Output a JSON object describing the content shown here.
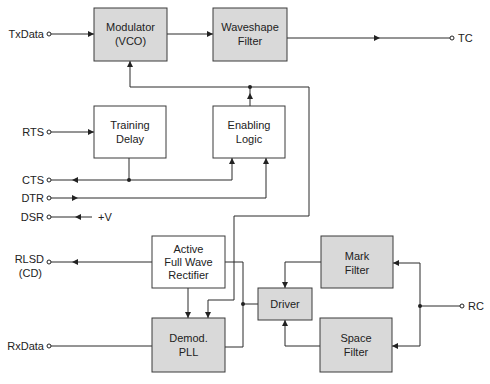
{
  "diagram": {
    "type": "block-diagram",
    "blocks": {
      "modulator": {
        "line1": "Modulator",
        "line2": "(VCO)",
        "shaded": true
      },
      "waveshape": {
        "line1": "Waveshape",
        "line2": "Filter",
        "shaded": true
      },
      "training": {
        "line1": "Training",
        "line2": "Delay",
        "shaded": false
      },
      "enabling": {
        "line1": "Enabling",
        "line2": "Logic",
        "shaded": false
      },
      "rectifier": {
        "line1": "Active",
        "line2": "Full Wave",
        "line3": "Rectifier",
        "shaded": false
      },
      "demod": {
        "line1": "Demod.",
        "line2": "PLL",
        "shaded": true
      },
      "driver": {
        "line1": "Driver",
        "shaded": true
      },
      "mark": {
        "line1": "Mark",
        "line2": "Filter",
        "shaded": true
      },
      "space": {
        "line1": "Space",
        "line2": "Filter",
        "shaded": true
      }
    },
    "signals": {
      "txdata": "TxData",
      "tc": "TC",
      "rts": "RTS",
      "cts": "CTS",
      "dtr": "DTR",
      "dsr": "DSR",
      "plusv": "+V",
      "rlsd": "RLSD",
      "cd": "(CD)",
      "rxdata": "RxData",
      "rc": "RC"
    },
    "connections": [
      {
        "from": "TxData",
        "to": "Modulator (VCO)"
      },
      {
        "from": "Modulator (VCO)",
        "to": "Waveshape Filter"
      },
      {
        "from": "Waveshape Filter",
        "to": "TC"
      },
      {
        "from": "RTS",
        "to": "Training Delay"
      },
      {
        "from": "Training Delay",
        "to": "CTS"
      },
      {
        "from": "Training Delay",
        "to": "Enabling Logic"
      },
      {
        "from": "DTR",
        "to": "Enabling Logic"
      },
      {
        "from": "+V",
        "to": "DSR"
      },
      {
        "from": "Enabling Logic",
        "to": "Modulator (VCO)"
      },
      {
        "from": "Enabling Logic",
        "to": "Demod. PLL"
      },
      {
        "from": "Active Full Wave Rectifier",
        "to": "RLSD (CD)"
      },
      {
        "from": "Active Full Wave Rectifier",
        "to": "Demod. PLL"
      },
      {
        "from": "Driver",
        "to": "Active Full Wave Rectifier"
      },
      {
        "from": "Driver",
        "to": "Demod. PLL"
      },
      {
        "from": "Demod. PLL",
        "to": "RxData"
      },
      {
        "from": "Mark Filter",
        "to": "Driver"
      },
      {
        "from": "Space Filter",
        "to": "Driver"
      },
      {
        "from": "RC",
        "to": "Mark Filter"
      },
      {
        "from": "RC",
        "to": "Space Filter"
      }
    ]
  }
}
